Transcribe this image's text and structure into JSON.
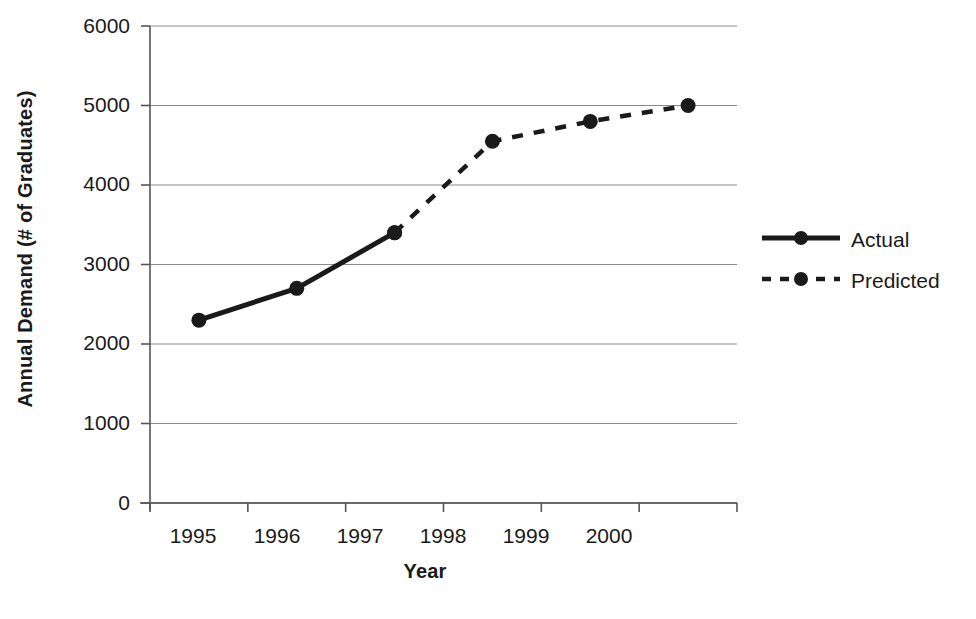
{
  "chart_data": {
    "type": "line",
    "title": "",
    "xlabel": "Year",
    "ylabel": "Annual Demand (# of Graduates)",
    "categories": [
      "1995",
      "1996",
      "1997",
      "1998",
      "1999",
      "2000"
    ],
    "ylim": [
      0,
      6000
    ],
    "yticks": [
      0,
      1000,
      2000,
      3000,
      4000,
      5000,
      6000
    ],
    "ytick_labels": [
      "0",
      "1000",
      "2000",
      "3000",
      "4000",
      "5000",
      "6000"
    ],
    "grid": "horizontal",
    "legend_position": "right",
    "series": [
      {
        "name": "Actual",
        "style": "solid",
        "color": "#1a1a1a",
        "marker": "circle",
        "x": [
          "1995",
          "1996",
          "1997"
        ],
        "values": [
          2300,
          2700,
          3400
        ]
      },
      {
        "name": "Predicted",
        "style": "dashed",
        "color": "#1a1a1a",
        "marker": "circle",
        "x": [
          "1997",
          "1998",
          "1999",
          "2000"
        ],
        "values": [
          3400,
          4550,
          4800,
          5000
        ]
      }
    ]
  },
  "axes": {
    "y_title": "Annual Demand (# of Graduates)",
    "x_title": "Year"
  },
  "ticks": {
    "y": [
      "6000",
      "5000",
      "4000",
      "3000",
      "2000",
      "1000",
      "0"
    ],
    "x": [
      "1995",
      "1996",
      "1997",
      "1998",
      "1999",
      "2000"
    ]
  },
  "legend": {
    "items": [
      {
        "label": "Actual",
        "style": "solid"
      },
      {
        "label": "Predicted",
        "style": "dashed"
      }
    ]
  },
  "colors": {
    "line": "#1a1a1a",
    "grid": "#8a8a8a",
    "axis": "#555555",
    "background": "#ffffff"
  }
}
